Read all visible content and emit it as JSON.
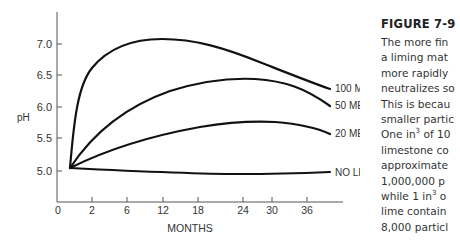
{
  "chart_data": {
    "type": "line",
    "title": "",
    "xlabel": "MONTHS",
    "ylabel": "pH",
    "x_ticks": [
      "0",
      "2",
      "6",
      "12",
      "18",
      "24",
      "30",
      "36"
    ],
    "y_ticks": [
      "5.0",
      "5.5",
      "6.0",
      "6.5",
      "7.0"
    ],
    "ylim": [
      4.6,
      7.5
    ],
    "grid": false,
    "legend_position": "inline-right",
    "series": [
      {
        "name": "100 MESH",
        "x": [
          1,
          2,
          4,
          6,
          9,
          12,
          18,
          24,
          30,
          38
        ],
        "values": [
          5.05,
          6.1,
          6.65,
          6.85,
          7.0,
          7.05,
          7.0,
          6.85,
          6.6,
          6.3
        ]
      },
      {
        "name": "50 MESH",
        "x": [
          1,
          4,
          8,
          12,
          18,
          24,
          28,
          32,
          38
        ],
        "values": [
          5.05,
          5.6,
          5.9,
          6.1,
          6.3,
          6.38,
          6.38,
          6.3,
          6.0
        ]
      },
      {
        "name": "20 MESH",
        "x": [
          1,
          6,
          12,
          18,
          24,
          28,
          32,
          38
        ],
        "values": [
          5.05,
          5.3,
          5.5,
          5.65,
          5.75,
          5.75,
          5.72,
          5.55
        ]
      },
      {
        "name": "NO LIME",
        "x": [
          1,
          6,
          12,
          18,
          24,
          30,
          38
        ],
        "values": [
          5.05,
          5.0,
          4.97,
          4.95,
          4.95,
          4.95,
          4.97
        ]
      }
    ]
  },
  "caption": {
    "title": "FIGURE 7-9",
    "lines": [
      "The more fin",
      "a liming mat",
      "more rapidly",
      "neutralizes so",
      "This is becau",
      "smaller partic",
      "One in{3} of 10",
      "limestone co",
      "approximate",
      "1,000,000 p",
      "while 1 in{3} o",
      "lime contain",
      "8,000 particl"
    ]
  }
}
